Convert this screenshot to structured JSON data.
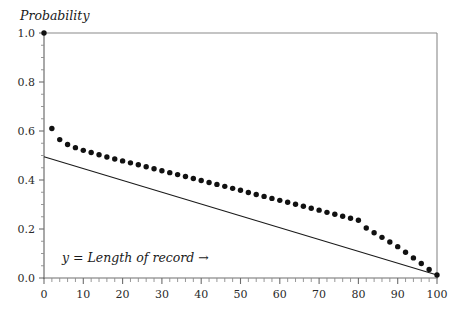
{
  "chart_data": {
    "type": "scatter",
    "title": "",
    "ylabel": "Probability",
    "xlabel": "y = Length of record →",
    "xlim": [
      0,
      100
    ],
    "ylim": [
      0,
      1.0
    ],
    "grid": false,
    "legend": "none",
    "x_ticks_major": [
      0,
      10,
      20,
      30,
      40,
      50,
      60,
      70,
      80,
      90,
      100
    ],
    "x_tick_labels": [
      "0",
      "10",
      "20",
      "30",
      "40",
      "50",
      "60",
      "70",
      "80",
      "90",
      "100"
    ],
    "x_tick_minor_step": 2,
    "y_ticks_major": [
      0.0,
      0.2,
      0.4,
      0.6,
      0.8,
      1.0
    ],
    "y_tick_labels": [
      "0.0",
      "0.2",
      "0.4",
      "0.6",
      "0.8",
      "1.0"
    ],
    "y_tick_minor_step": 0.05,
    "series": [
      {
        "name": "probability points",
        "marker": "filled-circle",
        "marker_color": "#111111",
        "x": [
          0,
          2,
          4,
          6,
          8,
          10,
          12,
          14,
          16,
          18,
          20,
          22,
          24,
          26,
          28,
          30,
          32,
          34,
          36,
          38,
          40,
          42,
          44,
          46,
          48,
          50,
          52,
          54,
          56,
          58,
          60,
          62,
          64,
          66,
          68,
          70,
          72,
          74,
          76,
          78,
          80,
          82,
          84,
          86,
          88,
          90,
          92,
          94,
          96,
          98,
          100
        ],
        "values": [
          1.0,
          0.61,
          0.565,
          0.545,
          0.532,
          0.521,
          0.512,
          0.503,
          0.494,
          0.486,
          0.478,
          0.47,
          0.462,
          0.454,
          0.446,
          0.438,
          0.43,
          0.422,
          0.414,
          0.406,
          0.398,
          0.39,
          0.382,
          0.374,
          0.366,
          0.358,
          0.349,
          0.341,
          0.333,
          0.325,
          0.317,
          0.309,
          0.301,
          0.293,
          0.285,
          0.277,
          0.268,
          0.26,
          0.252,
          0.244,
          0.236,
          0.204,
          0.185,
          0.166,
          0.147,
          0.128,
          0.105,
          0.082,
          0.059,
          0.035,
          0.012
        ]
      },
      {
        "name": "reference line",
        "marker": "none",
        "line_color": "#1a1a1a",
        "x": [
          0,
          100
        ],
        "values": [
          0.495,
          0.012
        ]
      }
    ]
  },
  "axes": {
    "y_axis_title": "Probability",
    "x_axis_title": "y = Length of record →"
  }
}
